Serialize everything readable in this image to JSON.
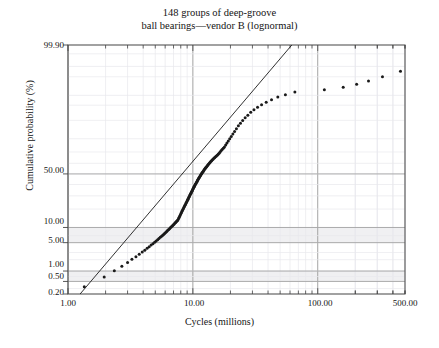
{
  "chart_data": {
    "type": "scatter",
    "title": "148 groups of deep-groove\nball bearings—vendor B (lognormal)",
    "title_line1": "148 groups of deep-groove",
    "title_line2": "ball bearings—vendor B (lognormal)",
    "xlabel": "Cycles (millions)",
    "ylabel": "Cumulative probability (%)",
    "xscale": "log",
    "yscale": "probability",
    "xlim": [
      1.0,
      500.0
    ],
    "ylim": [
      0.2,
      99.9
    ],
    "grid": true,
    "legend": "none",
    "xticks": [
      "1.00",
      "10.00",
      "100.00",
      "500.00"
    ],
    "xtick_values": [
      1.0,
      10.0,
      100.0,
      500.0
    ],
    "yticks": [
      "99.90",
      "50.00",
      "10.00",
      "5.00",
      "1.00",
      "0.50",
      "0.20"
    ],
    "ytick_values": [
      99.9,
      50.0,
      10.0,
      5.0,
      1.0,
      0.5,
      0.2
    ],
    "annotations": [
      "fitted lognormal reference line"
    ],
    "series": [
      {
        "name": "ball bearing groups",
        "marker": "filled-circle",
        "color": "#1a1a1a",
        "n_points": 148,
        "x": [
          1.35,
          1.95,
          2.35,
          2.7,
          3.0,
          3.25,
          3.5,
          3.72,
          3.93,
          4.12,
          4.3,
          4.47,
          4.63,
          4.79,
          4.94,
          5.08,
          5.22,
          5.35,
          5.48,
          5.61,
          5.73,
          5.85,
          5.96,
          6.08,
          6.19,
          6.29,
          6.4,
          6.5,
          6.6,
          6.7,
          6.8,
          6.89,
          6.99,
          7.08,
          7.17,
          7.26,
          7.35,
          7.43,
          7.52,
          7.6,
          7.69,
          7.77,
          7.85,
          7.93,
          8.01,
          8.09,
          8.17,
          8.24,
          8.32,
          8.4,
          8.47,
          8.55,
          8.62,
          8.7,
          8.77,
          8.84,
          8.92,
          8.99,
          9.06,
          9.13,
          9.2,
          9.27,
          9.34,
          9.41,
          9.48,
          9.55,
          9.62,
          9.69,
          9.76,
          9.83,
          9.9,
          9.97,
          10.04,
          10.11,
          10.18,
          10.26,
          10.33,
          10.4,
          10.48,
          10.55,
          10.63,
          10.71,
          10.79,
          10.87,
          10.95,
          11.03,
          11.12,
          11.2,
          11.29,
          11.38,
          11.47,
          11.57,
          11.66,
          11.76,
          11.86,
          11.97,
          12.07,
          12.18,
          12.3,
          12.41,
          12.53,
          12.66,
          12.78,
          12.92,
          13.05,
          13.19,
          13.34,
          13.49,
          13.65,
          13.81,
          13.98,
          14.16,
          14.35,
          14.54,
          14.75,
          14.96,
          15.19,
          15.42,
          15.67,
          15.94,
          16.22,
          16.51,
          16.83,
          17.16,
          17.52,
          17.9,
          18.31,
          18.75,
          19.22,
          19.74,
          20.3,
          20.91,
          21.58,
          22.32,
          23.14,
          24.05,
          25.07,
          26.23,
          27.55,
          29.07,
          30.85,
          32.96,
          35.51,
          38.66,
          42.66,
          47.9,
          55.1,
          65.6,
          113.0,
          160.0,
          205.0,
          255.0,
          330.0,
          460.0
        ],
        "y": [
          0.34,
          0.68,
          1.02,
          1.36,
          1.7,
          2.04,
          2.38,
          2.72,
          3.06,
          3.4,
          3.74,
          4.08,
          4.42,
          4.76,
          5.1,
          5.44,
          5.78,
          6.12,
          6.46,
          6.8,
          7.14,
          7.48,
          7.82,
          8.16,
          8.5,
          8.84,
          9.18,
          9.52,
          9.86,
          10.2,
          10.54,
          10.88,
          11.22,
          11.56,
          11.9,
          12.24,
          12.58,
          12.92,
          13.26,
          13.6,
          14.28,
          14.96,
          15.64,
          16.32,
          17.0,
          17.68,
          18.36,
          19.04,
          19.72,
          20.4,
          21.08,
          21.76,
          22.44,
          23.12,
          23.8,
          24.48,
          25.16,
          25.84,
          26.52,
          27.2,
          27.88,
          28.56,
          29.24,
          29.92,
          30.6,
          31.28,
          31.96,
          32.64,
          33.32,
          34.0,
          34.68,
          35.36,
          36.04,
          36.72,
          37.4,
          38.08,
          38.76,
          39.44,
          40.12,
          40.8,
          41.48,
          42.16,
          42.84,
          43.52,
          44.2,
          44.88,
          45.56,
          46.24,
          46.92,
          47.6,
          48.28,
          48.96,
          49.64,
          50.32,
          51.0,
          51.68,
          52.36,
          53.04,
          53.72,
          54.4,
          55.08,
          55.76,
          56.44,
          57.12,
          57.8,
          58.48,
          59.16,
          59.84,
          60.52,
          61.2,
          61.88,
          62.56,
          63.24,
          63.92,
          64.6,
          65.28,
          65.96,
          66.64,
          67.32,
          68.0,
          69.0,
          70.0,
          71.0,
          72.0,
          73.0,
          74.0,
          75.5,
          77.0,
          78.5,
          80.0,
          81.5,
          83.0,
          84.5,
          86.0,
          87.5,
          88.7,
          89.9,
          91.0,
          92.0,
          93.0,
          93.8,
          94.5,
          95.1,
          95.7,
          96.2,
          96.7,
          97.1,
          97.5,
          97.8,
          98.1,
          98.4,
          98.7,
          99.0,
          99.3
        ]
      }
    ],
    "reference_line": {
      "name": "lognormal fit line",
      "color": "#1a1a1a",
      "x": [
        1.25,
        62.0
      ],
      "y": [
        0.2,
        99.9
      ]
    },
    "shaded_bands": [
      {
        "from": 5.0,
        "to": 10.0
      },
      {
        "from": 0.5,
        "to": 1.0
      }
    ]
  }
}
